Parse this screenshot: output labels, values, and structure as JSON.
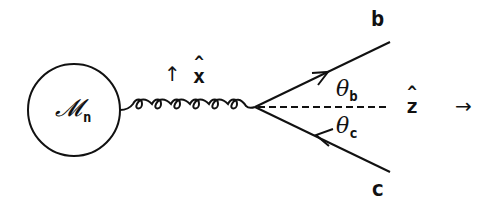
{
  "diagram": {
    "type": "feynman-diagram",
    "blob": {
      "symbol": "𝓜",
      "subscript": "n"
    },
    "gluon": {
      "loops": 7,
      "direction_arrow": "↑",
      "polarization_label": "x"
    },
    "vertex": {
      "x": 255,
      "y": 107
    },
    "outgoing": [
      {
        "label": "b",
        "angle_label": "θ",
        "angle_subscript": "b",
        "arrow": "forward"
      },
      {
        "label": "c",
        "angle_label": "θ",
        "angle_subscript": "c",
        "arrow": "backward"
      }
    ],
    "axis": {
      "label": "z",
      "arrow": "→",
      "style": "dashed"
    }
  },
  "colors": {
    "ink": "#111111",
    "background": "#ffffff"
  }
}
